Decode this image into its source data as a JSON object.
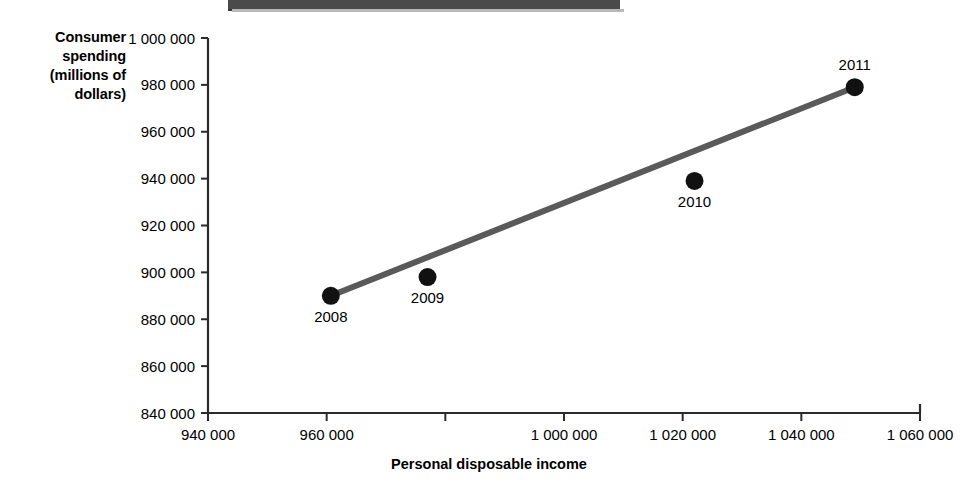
{
  "figure": {
    "name": "consumer-spending-vs-disposable-income-scatter"
  },
  "top_bar": {
    "caption": ""
  },
  "axes": {
    "y_title_lines": [
      "Consumer",
      "spending",
      "(millions of",
      "dollars)"
    ],
    "x_title": "Personal disposable income"
  },
  "chart_data": {
    "type": "scatter",
    "title": "",
    "xlabel": "Personal disposable income",
    "ylabel": "Consumer spending (millions of dollars)",
    "xlim": [
      940000,
      1060000
    ],
    "ylim": [
      840000,
      1000000
    ],
    "grid": false,
    "legend": "none",
    "x_tick_values": [
      940000,
      960000,
      980000,
      1000000,
      1020000,
      1040000,
      1060000
    ],
    "x_tick_labels": [
      "940 000",
      "960 000",
      "1 000 000",
      "1 020 000",
      "1 040 000",
      "1 060 000"
    ],
    "y_tick_values": [
      840000,
      860000,
      880000,
      900000,
      920000,
      940000,
      960000,
      980000,
      1000000
    ],
    "y_tick_labels": [
      "840 000",
      "860 000",
      "880 000",
      "900 000",
      "920 000",
      "940 000",
      "960 000",
      "980 000",
      "1 000 000"
    ],
    "points": [
      {
        "label": "2008",
        "x": 960700,
        "y": 890000,
        "label_pos": "below"
      },
      {
        "label": "2009",
        "x": 977000,
        "y": 898000,
        "label_pos": "below"
      },
      {
        "label": "2010",
        "x": 1022000,
        "y": 939000,
        "label_pos": "below"
      },
      {
        "label": "2011",
        "x": 1049000,
        "y": 979000,
        "label_pos": "above"
      }
    ],
    "trendline": {
      "name": "line of best fit",
      "x_start": 960700,
      "y_start": 890000,
      "x_end": 1049000,
      "y_end": 979000
    }
  },
  "colors": {
    "marker": "#111111",
    "trendline": "#5a5a5a",
    "axis": "#2b2b2b",
    "text": "#000000",
    "top_bar": "#4a4a4a",
    "background": "#ffffff"
  }
}
